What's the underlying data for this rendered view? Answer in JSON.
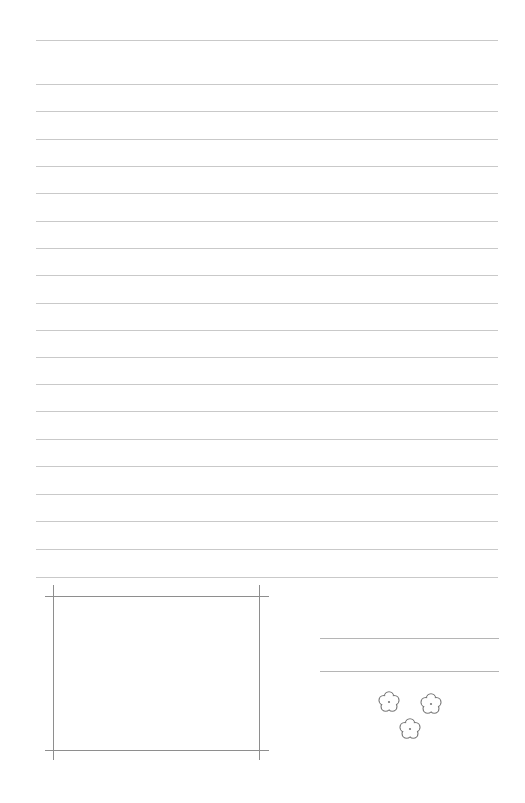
{
  "page": {
    "type": "lined-writing-paper",
    "background": "#ffffff",
    "rule_color": "#c9c9c9",
    "frame_color": "#8e8e8e",
    "flower_color": "#7a7a7a"
  },
  "rules": {
    "x_start": 36,
    "x_end": 498,
    "y_positions": [
      40,
      84,
      111,
      139,
      166,
      193,
      221,
      248,
      275,
      303,
      330,
      357,
      384,
      411,
      439,
      466,
      494,
      521,
      549,
      577
    ]
  },
  "photo_frame": {
    "top_y": 596,
    "bottom_y": 750,
    "left_x": 53,
    "right_x": 259,
    "h_extent": [
      45,
      269
    ],
    "v_extent": [
      585,
      760
    ]
  },
  "signature_lines": {
    "x_start": 320,
    "x_end": 499,
    "y_positions": [
      638,
      671
    ]
  },
  "flowers": [
    {
      "cx": 389,
      "cy": 702
    },
    {
      "cx": 431,
      "cy": 704
    },
    {
      "cx": 410,
      "cy": 729
    }
  ]
}
